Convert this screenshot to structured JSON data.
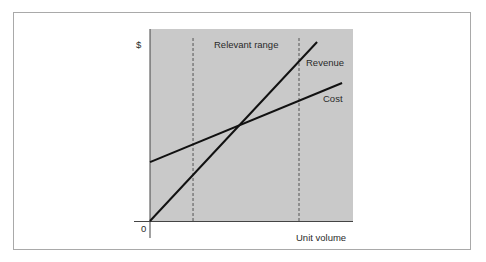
{
  "chart_data": {
    "type": "line",
    "title": "",
    "xlabel": "Unit volume",
    "ylabel": "$",
    "origin_label": "0",
    "xlim": [
      0,
      100
    ],
    "ylim": [
      0,
      100
    ],
    "grid": false,
    "legend": "inline labels at line ends",
    "plot_background": "#c9c9c9",
    "series": [
      {
        "name": "Revenue",
        "x": [
          0,
          82.3
        ],
        "y": [
          0,
          93.2
        ],
        "color": "#111111"
      },
      {
        "name": "Cost",
        "x": [
          0,
          94.6
        ],
        "y": [
          30.7,
          71.9
        ],
        "color": "#111111"
      }
    ],
    "annotations": [
      {
        "type": "vline",
        "x": 21.2,
        "style": "dashed"
      },
      {
        "type": "vline",
        "x": 73.4,
        "style": "dashed"
      },
      {
        "type": "text",
        "text": "Relevant range",
        "x": 47.3,
        "y": 91
      }
    ],
    "break_even": {
      "x": 44.8,
      "y": 50.3
    }
  },
  "labels": {
    "y_axis": "$",
    "x_axis": "Unit volume",
    "origin": "0",
    "relevant_range": "Relevant range",
    "revenue": "Revenue",
    "cost": "Cost"
  }
}
